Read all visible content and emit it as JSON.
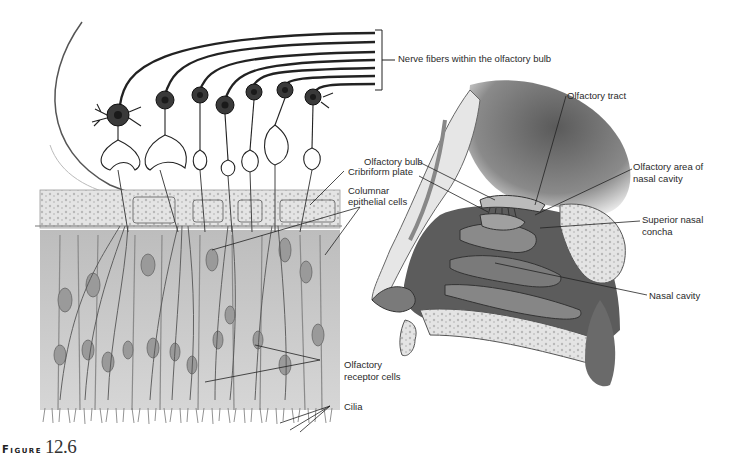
{
  "figure": {
    "word": "Figure",
    "number": "12.6"
  },
  "labels": {
    "nerve_fibers": "Nerve fibers within the olfactory bulb",
    "olfactory_tract": "Olfactory tract",
    "olfactory_bulb": "Olfactory bulb",
    "olfactory_area_line1": "Olfactory area of",
    "olfactory_area_line2": "nasal cavity",
    "cribriform_plate": "Cribriform plate",
    "columnar_line1": "Columnar",
    "columnar_line2": "epithelial cells",
    "superior_concha_line1": "Superior nasal",
    "superior_concha_line2": "concha",
    "nasal_cavity": "Nasal cavity",
    "receptor_line1": "Olfactory",
    "receptor_line2": "receptor cells",
    "cilia": "Cilia"
  },
  "colors": {
    "ink": "#222222",
    "epithelium": "#c9c9c9",
    "bone": "#dcdcdc",
    "tissue_dark": "#6a6a6a",
    "cell_body": "#5a5a5a"
  }
}
